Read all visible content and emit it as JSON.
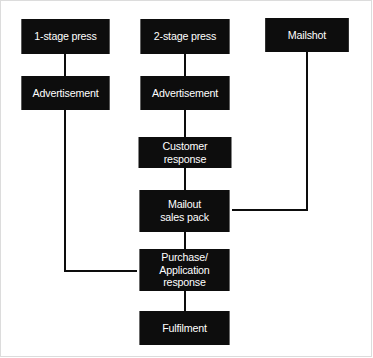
{
  "diagram": {
    "type": "flowchart",
    "background_color": "#ffffff",
    "node_fill_color": "#0d0d0d",
    "node_text_color": "#ffffff",
    "connector_color": "#0d0d0d",
    "nodes": [
      {
        "id": "one_stage_press",
        "label": "1-stage press",
        "x": 18,
        "y": 19,
        "w": 95,
        "h": 35
      },
      {
        "id": "two_stage_press",
        "label": "2-stage press",
        "x": 137,
        "y": 19,
        "w": 96,
        "h": 35
      },
      {
        "id": "mailshot",
        "label": "Mailshot",
        "x": 262,
        "y": 18,
        "w": 90,
        "h": 34
      },
      {
        "id": "advert_left",
        "label": "Advertisement",
        "x": 18,
        "y": 76,
        "w": 95,
        "h": 34
      },
      {
        "id": "advert_centre",
        "label": "Advertisement",
        "x": 137,
        "y": 76,
        "w": 96,
        "h": 34
      },
      {
        "id": "customer_response",
        "label": "Customer response",
        "x": 135,
        "y": 137,
        "w": 100,
        "h": 31
      },
      {
        "id": "mailout_sales_pack",
        "label": "Mailout\nsales pack",
        "x": 136,
        "y": 190,
        "w": 97,
        "h": 42
      },
      {
        "id": "purchase_application",
        "label": "Purchase/\nApplication response",
        "x": 136,
        "y": 249,
        "w": 97,
        "h": 42
      },
      {
        "id": "fulfilment",
        "label": "Fulfilment",
        "x": 136,
        "y": 311,
        "w": 97,
        "h": 34
      }
    ],
    "connectors": [
      {
        "id": "press1-to-advert",
        "from": "one_stage_press",
        "to": "advert_left"
      },
      {
        "id": "press2-to-advert",
        "from": "two_stage_press",
        "to": "advert_centre"
      },
      {
        "id": "advert-to-customer",
        "from": "advert_centre",
        "to": "customer_response"
      },
      {
        "id": "customer-to-mailout",
        "from": "customer_response",
        "to": "mailout_sales_pack"
      },
      {
        "id": "mailout-to-purchase",
        "from": "mailout_sales_pack",
        "to": "purchase_application"
      },
      {
        "id": "purchase-to-fulfilment",
        "from": "purchase_application",
        "to": "fulfilment"
      },
      {
        "id": "advert-left-to-purchase",
        "from": "advert_left",
        "to": "purchase_application"
      },
      {
        "id": "mailshot-to-mailout",
        "from": "mailshot",
        "to": "mailout_sales_pack"
      }
    ]
  }
}
